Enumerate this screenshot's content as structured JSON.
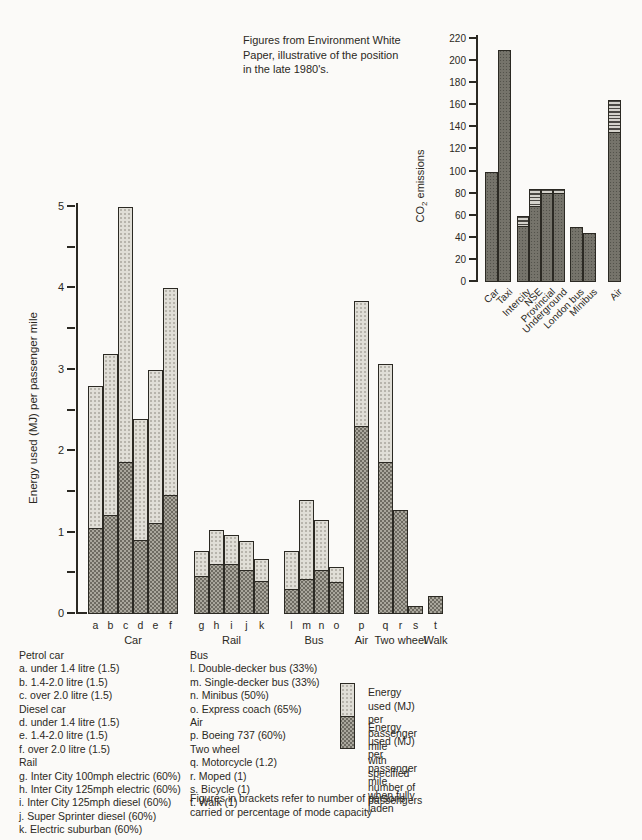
{
  "caption": "Figures from Environment White\nPaper,  illustrative of the position\nin the late 1980's.",
  "chart_data": [
    {
      "name": "energy-per-passenger-mile",
      "type": "bar",
      "stacked": true,
      "title": "",
      "xlabel": "",
      "ylabel": "Energy used (MJ) per passenger mile",
      "ylim": [
        0,
        5
      ],
      "ytick_step": 1,
      "yminor_step": 0.5,
      "grid": false,
      "legend_position": "bottom-right",
      "series": [
        {
          "name": "Energy used (MJ) per passenger mile when fully laden",
          "pattern": "dark"
        },
        {
          "name": "Energy used (MJ) per passenger mile with specified number of passengers",
          "pattern": "light"
        }
      ],
      "groups": [
        {
          "label": "Car",
          "bars": [
            {
              "id": "a",
              "fully_laden": 1.05,
              "with_specified": 2.8
            },
            {
              "id": "b",
              "fully_laden": 1.2,
              "with_specified": 3.2
            },
            {
              "id": "c",
              "fully_laden": 1.85,
              "with_specified": 5.0
            },
            {
              "id": "d",
              "fully_laden": 0.9,
              "with_specified": 2.4
            },
            {
              "id": "e",
              "fully_laden": 1.1,
              "with_specified": 3.0
            },
            {
              "id": "f",
              "fully_laden": 1.45,
              "with_specified": 4.0
            }
          ]
        },
        {
          "label": "Rail",
          "bars": [
            {
              "id": "g",
              "fully_laden": 0.45,
              "with_specified": 0.77
            },
            {
              "id": "h",
              "fully_laden": 0.6,
              "with_specified": 1.03
            },
            {
              "id": "i",
              "fully_laden": 0.6,
              "with_specified": 0.97
            },
            {
              "id": "j",
              "fully_laden": 0.53,
              "with_specified": 0.9
            },
            {
              "id": "k",
              "fully_laden": 0.39,
              "with_specified": 0.68
            }
          ]
        },
        {
          "label": "Bus",
          "bars": [
            {
              "id": "l",
              "fully_laden": 0.3,
              "with_specified": 0.78
            },
            {
              "id": "m",
              "fully_laden": 0.42,
              "with_specified": 1.4
            },
            {
              "id": "n",
              "fully_laden": 0.53,
              "with_specified": 1.15
            },
            {
              "id": "o",
              "fully_laden": 0.38,
              "with_specified": 0.58
            }
          ]
        },
        {
          "label": "Air",
          "bars": [
            {
              "id": "p",
              "fully_laden": 2.3,
              "with_specified": 3.85
            }
          ]
        },
        {
          "label": "Two wheel",
          "bars": [
            {
              "id": "q",
              "fully_laden": 1.85,
              "with_specified": 3.07
            },
            {
              "id": "r",
              "fully_laden": 1.28,
              "with_specified": 1.28
            },
            {
              "id": "s",
              "fully_laden": 0.1,
              "with_specified": 0.1
            }
          ]
        },
        {
          "label": "Walk",
          "bars": [
            {
              "id": "t",
              "fully_laden": 0.22,
              "with_specified": 0.22
            }
          ]
        }
      ]
    },
    {
      "name": "co2-emissions",
      "type": "bar",
      "stacked": true,
      "title": "",
      "xlabel": "",
      "ylabel": {
        "prefix": "CO",
        "sub": "2",
        "suffix": " emissions"
      },
      "ylim": [
        0,
        220
      ],
      "ytick_step": 20,
      "grid": false,
      "categories": [
        "Car",
        "Taxi",
        "Intercity",
        "NSE",
        "Provincial",
        "Underground",
        "London bus",
        "Minibus",
        "Air"
      ],
      "series": [
        {
          "name": "solid",
          "pattern": "inset-dark",
          "values": [
            100,
            210,
            50,
            68,
            80,
            80,
            50,
            44,
            135
          ]
        },
        {
          "name": "striped-top",
          "pattern": "stripe",
          "values": [
            0,
            0,
            10,
            16,
            4,
            4,
            0,
            0,
            30
          ]
        }
      ]
    }
  ],
  "legend_text": {
    "column1": [
      "Petrol car",
      "a. under 1.4 litre (1.5)",
      "b. 1.4-2.0 litre (1.5)",
      "c. over 2.0 litre (1.5)",
      "Diesel car",
      "d. under 1.4 litre (1.5)",
      "e. 1.4-2.0 litre (1.5)",
      "f. over 2.0 litre (1.5)",
      "Rail",
      "g. Inter City 100mph electric (60%)",
      "h. Inter City 125mph electric (60%)",
      "i. Inter City 125mph diesel (60%)",
      "j. Super Sprinter diesel (60%)",
      "k. Electric suburban (60%)"
    ],
    "column2": [
      "Bus",
      "l. Double-decker bus (33%)",
      "m. Single-decker bus (33%)",
      "n. Minibus (50%)",
      "o. Express coach (65%)",
      "Air",
      "p. Boeing 737 (60%)",
      "Two wheel",
      "q. Motorcycle (1.2)",
      "r. Moped (1)",
      "s. Bicycle (1)",
      "t. Walk (1)"
    ],
    "note": "Figures in brackets refer to number of persons\ncarried or percentage of mode capacity"
  },
  "key": {
    "specified_label": "Energy used (MJ) per passenger mile\nwith specified number of passengers",
    "laden_label": "Energy used (MJ) per passenger mile\nwhen fully laden"
  },
  "colors": {
    "ink": "#2b2923",
    "paper": "#fbfaf8",
    "bar_light": "#e0ded7",
    "bar_dark": "#aaa79d",
    "inset_bar": "#8e8b82"
  }
}
